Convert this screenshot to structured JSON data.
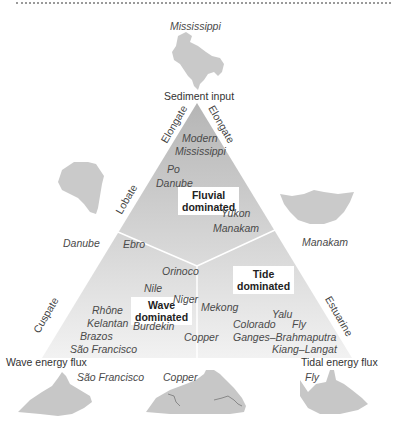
{
  "title_vertex_top": "Sediment input",
  "title_vertex_left": "Wave energy flux",
  "title_vertex_right": "Tidal energy flux",
  "edge_labels": {
    "left_upper": "Elongate",
    "right_upper": "Elongate",
    "left_mid": "Lobate",
    "left_lower": "Cuspate",
    "right_lower": "Estuarine"
  },
  "regions": {
    "fluvial": "Fluvial\ndominated",
    "fluvial_line1": "Fluvial",
    "fluvial_line2": "dominated",
    "wave_line1": "Wave",
    "wave_line2": "dominated",
    "tide_line1": "Tide",
    "tide_line2": "dominated"
  },
  "deltas": {
    "modern_mississippi_1": "Modern",
    "modern_mississippi_2": "Mississippi",
    "po": "Po",
    "danube": "Danube",
    "yukon": "Yukon",
    "manakam": "Manakam",
    "ebro": "Ebro",
    "orinoco": "Orinoco",
    "nile": "Nile",
    "niger": "Niger",
    "rhone": "Rhône",
    "kelantan": "Kelantan",
    "brazos": "Brazos",
    "sao_francisco": "São  Francisco",
    "burdekin": "Burdekin",
    "mekong": "Mekong",
    "copper": "Copper",
    "yalu": "Yalu",
    "colorado": "Colorado",
    "fly": "Fly",
    "ganges": "Ganges–Brahmaputra",
    "kiang": "Kiang–Langat"
  },
  "map_captions": {
    "mississippi": "Mississippi",
    "danube": "Danube",
    "manakam": "Manakam",
    "sao_francisco": "São Francisco",
    "copper": "Copper",
    "fly": "Fly"
  },
  "colors": {
    "triangle_top": "#b9b9b9",
    "triangle_bottom": "#efefef",
    "map_fill": "#c8c8c8",
    "divider": "#ffffff"
  }
}
